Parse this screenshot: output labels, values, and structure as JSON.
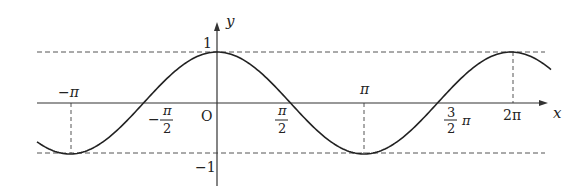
{
  "figure": {
    "function": "y = cos x",
    "axis_labels": {
      "x": "x",
      "y": "y"
    },
    "origin_label": "O",
    "y_ticks": [
      {
        "value": 1,
        "label": "1"
      },
      {
        "value": -1,
        "label": "−1"
      }
    ],
    "x_ticks": [
      {
        "value": "-π",
        "label": "−π"
      },
      {
        "value": "-π/2",
        "label_num": "π",
        "label_den": "2",
        "sign": "−"
      },
      {
        "value": "π/2",
        "label_num": "π",
        "label_den": "2"
      },
      {
        "value": "π",
        "label": "π"
      },
      {
        "value": "3π/2",
        "label_num": "3",
        "label_den": "2",
        "suffix": "π"
      },
      {
        "value": "2π",
        "label": "2π"
      }
    ],
    "guide_lines": [
      "y = 1 (dashed)",
      "y = −1 (dashed)",
      "x = −π (dashed)",
      "x = π (dashed)",
      "x = 2π (dashed)"
    ],
    "colors": {
      "curve": "#222222",
      "axes": "#333333",
      "dashed": "#555555"
    }
  }
}
